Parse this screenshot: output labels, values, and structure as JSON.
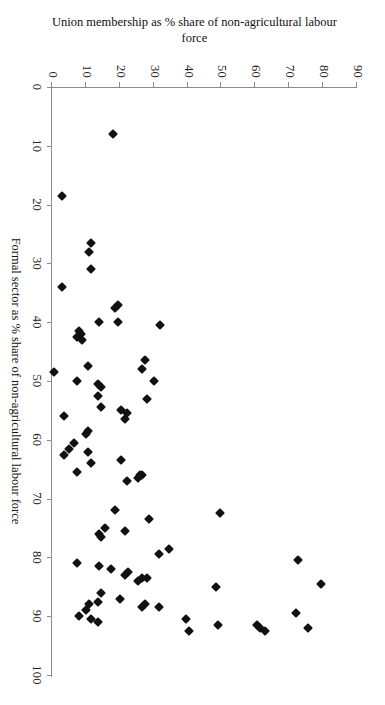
{
  "chart_data": {
    "type": "scatter",
    "title": "",
    "xlabel": "Formal sector as % share of non-agricultural labour force",
    "ylabel": "Union membership as % share of non-agricultural labour force",
    "xlim": [
      0,
      100
    ],
    "ylim": [
      0,
      90
    ],
    "xticks": [
      0,
      10,
      20,
      30,
      40,
      50,
      60,
      70,
      80,
      90,
      100
    ],
    "yticks": [
      0,
      10,
      20,
      30,
      40,
      50,
      60,
      70,
      80,
      90
    ],
    "grid": false,
    "legend": false,
    "marker": "diamond",
    "marker_color": "#111111",
    "axis_color": "#8a8a8a",
    "rotation_deg": 90,
    "points": [
      [
        8.0,
        18.0
      ],
      [
        18.5,
        3.0
      ],
      [
        26.5,
        11.5
      ],
      [
        28.0,
        11.0
      ],
      [
        31.0,
        11.5
      ],
      [
        34.0,
        3.0
      ],
      [
        37.0,
        19.5
      ],
      [
        37.5,
        18.5
      ],
      [
        40.5,
        32.0
      ],
      [
        40.0,
        19.5
      ],
      [
        40.0,
        14.0
      ],
      [
        41.5,
        8.0
      ],
      [
        42.0,
        8.5
      ],
      [
        42.5,
        7.5
      ],
      [
        43.0,
        9.0
      ],
      [
        46.5,
        27.5
      ],
      [
        47.5,
        10.5
      ],
      [
        48.0,
        26.5
      ],
      [
        48.5,
        0.5
      ],
      [
        50.0,
        7.5
      ],
      [
        50.0,
        30.0
      ],
      [
        50.5,
        13.5
      ],
      [
        51.0,
        14.5
      ],
      [
        52.5,
        13.5
      ],
      [
        53.0,
        28.0
      ],
      [
        54.5,
        14.5
      ],
      [
        55.0,
        20.5
      ],
      [
        55.5,
        22.0
      ],
      [
        56.0,
        3.5
      ],
      [
        56.5,
        21.5
      ],
      [
        58.5,
        10.5
      ],
      [
        59.0,
        10.0
      ],
      [
        60.5,
        6.5
      ],
      [
        61.5,
        5.0
      ],
      [
        62.0,
        10.5
      ],
      [
        62.5,
        3.5
      ],
      [
        63.5,
        20.5
      ],
      [
        64.0,
        11.5
      ],
      [
        65.5,
        7.5
      ],
      [
        66.0,
        26.5
      ],
      [
        66.0,
        26.0
      ],
      [
        66.5,
        25.5
      ],
      [
        67.0,
        22.0
      ],
      [
        72.0,
        18.5
      ],
      [
        72.5,
        49.5
      ],
      [
        73.5,
        28.5
      ],
      [
        75.0,
        15.5
      ],
      [
        75.5,
        21.5
      ],
      [
        76.0,
        14.0
      ],
      [
        76.5,
        14.5
      ],
      [
        78.5,
        34.5
      ],
      [
        79.5,
        31.5
      ],
      [
        80.5,
        72.5
      ],
      [
        81.0,
        7.5
      ],
      [
        81.5,
        14.0
      ],
      [
        82.0,
        17.5
      ],
      [
        82.5,
        22.5
      ],
      [
        83.0,
        21.5
      ],
      [
        83.5,
        26.5
      ],
      [
        83.5,
        28.0
      ],
      [
        84.0,
        25.5
      ],
      [
        84.5,
        79.5
      ],
      [
        85.0,
        48.5
      ],
      [
        86.0,
        14.5
      ],
      [
        87.0,
        20.0
      ],
      [
        87.5,
        13.5
      ],
      [
        88.0,
        27.5
      ],
      [
        88.0,
        11.0
      ],
      [
        88.5,
        26.5
      ],
      [
        88.5,
        31.5
      ],
      [
        89.0,
        10.0
      ],
      [
        89.5,
        72.0
      ],
      [
        90.0,
        8.0
      ],
      [
        90.5,
        11.5
      ],
      [
        90.5,
        39.5
      ],
      [
        91.0,
        13.5
      ],
      [
        91.5,
        49.0
      ],
      [
        91.5,
        60.5
      ],
      [
        92.0,
        75.5
      ],
      [
        92.0,
        61.5
      ],
      [
        92.5,
        40.5
      ],
      [
        92.5,
        63.0
      ]
    ]
  }
}
